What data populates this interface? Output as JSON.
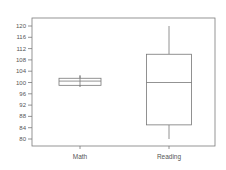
{
  "chart_data": {
    "type": "box",
    "title": "",
    "xlabel": "",
    "ylabel": "",
    "categories": [
      "Math",
      "Reading"
    ],
    "series": [
      {
        "name": "Math",
        "min": 98.5,
        "q1": 99,
        "median": 100.5,
        "q3": 101.5,
        "max": 102.5
      },
      {
        "name": "Reading",
        "min": 80,
        "q1": 85,
        "median": 100,
        "q3": 110,
        "max": 120
      }
    ],
    "yticks": [
      80,
      84,
      88,
      92,
      96,
      100,
      104,
      108,
      112,
      116,
      120
    ],
    "ylim": [
      78,
      122
    ],
    "grid": false,
    "legend": "none"
  },
  "colors": {
    "axis": "#7a7a7a",
    "box": "#777777",
    "text": "#555555",
    "background": "#ffffff"
  }
}
